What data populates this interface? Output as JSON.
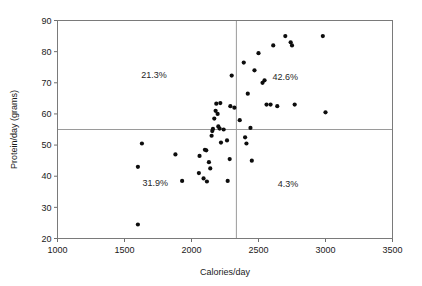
{
  "chart_data": {
    "type": "scatter",
    "title": "",
    "xlabel": "Calories/day",
    "ylabel": "Protein/day (grams)",
    "xlim": [
      1000,
      3500
    ],
    "ylim": [
      20,
      90
    ],
    "xticks": [
      1000,
      1500,
      2000,
      2500,
      3000,
      3500
    ],
    "yticks": [
      20,
      30,
      40,
      50,
      60,
      70,
      80,
      90
    ],
    "grid": false,
    "legend": "none",
    "reference_lines": {
      "vertical_x": 2335,
      "horizontal_y": 55
    },
    "quadrant_annotations": [
      {
        "label": "21.3%",
        "x": 1720,
        "y": 71.5
      },
      {
        "label": "42.6%",
        "x": 2700,
        "y": 71.0
      },
      {
        "label": "31.9%",
        "x": 1730,
        "y": 37.0
      },
      {
        "label": "4.3%",
        "x": 2720,
        "y": 36.5
      }
    ],
    "points": [
      {
        "x": 1600,
        "y": 24.5
      },
      {
        "x": 1600,
        "y": 43.0
      },
      {
        "x": 1630,
        "y": 50.5
      },
      {
        "x": 1880,
        "y": 47.0
      },
      {
        "x": 1930,
        "y": 38.5
      },
      {
        "x": 2055,
        "y": 41.0
      },
      {
        "x": 2060,
        "y": 46.5
      },
      {
        "x": 2090,
        "y": 39.3
      },
      {
        "x": 2100,
        "y": 48.5
      },
      {
        "x": 2110,
        "y": 48.3
      },
      {
        "x": 2115,
        "y": 38.3
      },
      {
        "x": 2130,
        "y": 44.5
      },
      {
        "x": 2140,
        "y": 42.5
      },
      {
        "x": 2150,
        "y": 53.0
      },
      {
        "x": 2155,
        "y": 54.5
      },
      {
        "x": 2160,
        "y": 55.2
      },
      {
        "x": 2170,
        "y": 58.5
      },
      {
        "x": 2180,
        "y": 61.0
      },
      {
        "x": 2185,
        "y": 63.3
      },
      {
        "x": 2195,
        "y": 60.0
      },
      {
        "x": 2200,
        "y": 56.0
      },
      {
        "x": 2210,
        "y": 55.3
      },
      {
        "x": 2215,
        "y": 63.5
      },
      {
        "x": 2220,
        "y": 50.8
      },
      {
        "x": 2240,
        "y": 55.0
      },
      {
        "x": 2265,
        "y": 51.5
      },
      {
        "x": 2270,
        "y": 38.5
      },
      {
        "x": 2285,
        "y": 45.5
      },
      {
        "x": 2290,
        "y": 62.5
      },
      {
        "x": 2300,
        "y": 72.3
      },
      {
        "x": 2320,
        "y": 62.0
      },
      {
        "x": 2360,
        "y": 58.0
      },
      {
        "x": 2390,
        "y": 76.5
      },
      {
        "x": 2400,
        "y": 52.5
      },
      {
        "x": 2410,
        "y": 50.5
      },
      {
        "x": 2420,
        "y": 66.5
      },
      {
        "x": 2440,
        "y": 55.5
      },
      {
        "x": 2450,
        "y": 45.0
      },
      {
        "x": 2470,
        "y": 74.0
      },
      {
        "x": 2500,
        "y": 79.5
      },
      {
        "x": 2530,
        "y": 70.0
      },
      {
        "x": 2545,
        "y": 70.8
      },
      {
        "x": 2560,
        "y": 63.0
      },
      {
        "x": 2590,
        "y": 63.0
      },
      {
        "x": 2610,
        "y": 82.0
      },
      {
        "x": 2640,
        "y": 62.5
      },
      {
        "x": 2700,
        "y": 85.0
      },
      {
        "x": 2740,
        "y": 83.0
      },
      {
        "x": 2750,
        "y": 82.0
      },
      {
        "x": 2770,
        "y": 63.0
      },
      {
        "x": 2980,
        "y": 85.0
      },
      {
        "x": 3000,
        "y": 60.5
      }
    ]
  }
}
